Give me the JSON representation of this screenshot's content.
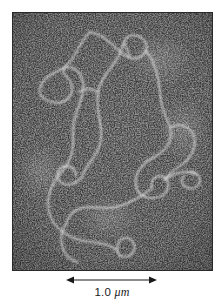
{
  "figure": {
    "type": "electron-micrograph",
    "background_color": "#4c4c4c",
    "filament_color": "#e8e8e8",
    "speckle_color": "#f2f2f2",
    "border_color": "#2a2a2a"
  },
  "micrograph": {
    "alt": "dark grainy electron micrograph field with a white looping DNA filament",
    "x": 12,
    "y": 12,
    "width": 201,
    "height": 259
  },
  "scale_bar": {
    "value": "1.0",
    "unit": "μm",
    "label": "1.0 μm",
    "arrow_style": "double-headed",
    "arrow_left_x": 66,
    "arrow_right_x": 157,
    "arrow_y": 280,
    "color": "#1a1a1a"
  }
}
